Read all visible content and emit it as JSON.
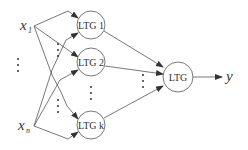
{
  "inputs": {
    "x1": "x",
    "x1_sub": "1",
    "xn": "x",
    "xn_sub": "n"
  },
  "hidden_nodes": [
    {
      "label": "LTG 1"
    },
    {
      "label": "LTG 2"
    },
    {
      "label": "LTG k"
    }
  ],
  "output_node": {
    "label": "LTG"
  },
  "output_var": "y",
  "colors": {
    "stroke": "#555555",
    "text": "#333333"
  }
}
